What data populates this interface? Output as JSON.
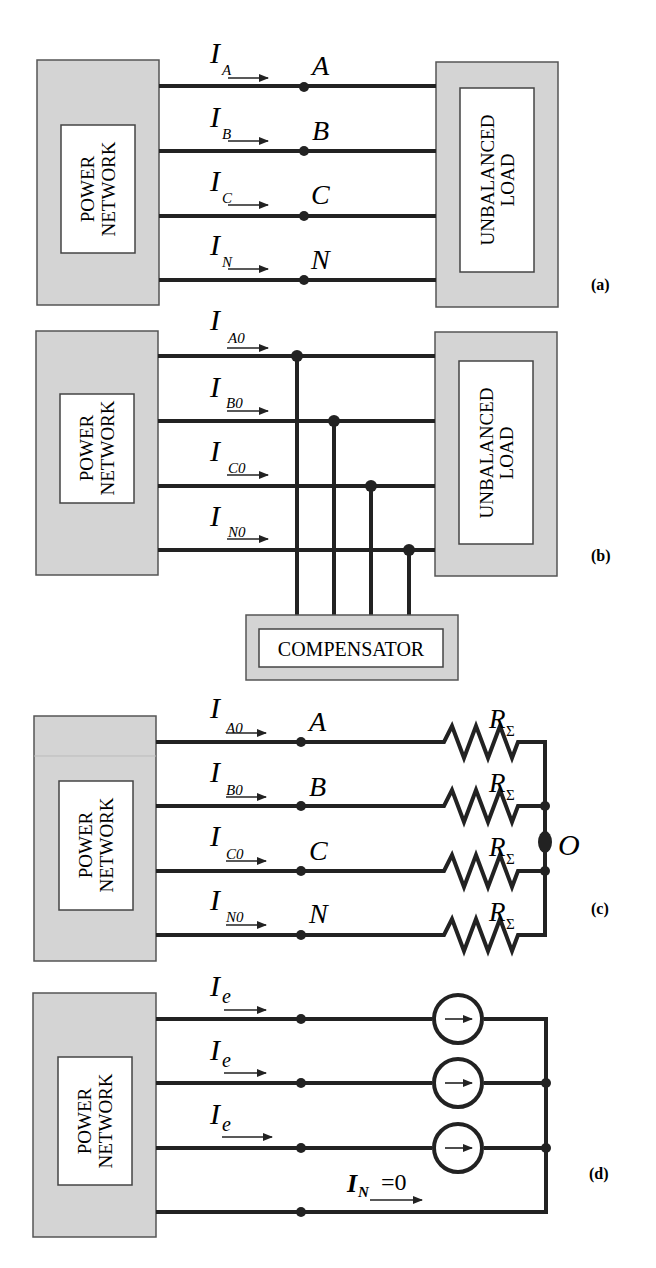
{
  "panels": {
    "a": {
      "label": "(a)",
      "source_box": "POWER NETWORK",
      "source_line1": "POWER",
      "source_line2": "NETWORK",
      "load_line1": "UNBALANCED",
      "load_line2": "LOAD",
      "currents": [
        {
          "main": "I",
          "sub": "A",
          "node": "A"
        },
        {
          "main": "I",
          "sub": "B",
          "node": "B"
        },
        {
          "main": "I",
          "sub": "C",
          "node": "C"
        },
        {
          "main": "I",
          "sub": "N",
          "node": "N"
        }
      ]
    },
    "b": {
      "label": "(b)",
      "source_line1": "POWER",
      "source_line2": "NETWORK",
      "load_line1": "UNBALANCED",
      "load_line2": "LOAD",
      "compensator": "COMPENSATOR",
      "currents": [
        {
          "main": "I",
          "sub": "A0"
        },
        {
          "main": "I",
          "sub": "B0"
        },
        {
          "main": "I",
          "sub": "C0"
        },
        {
          "main": "I",
          "sub": "N0"
        }
      ]
    },
    "c": {
      "label": "(c)",
      "source_line1": "POWER",
      "source_line2": "NETWORK",
      "neutral_point": "O",
      "resistor_main": "R",
      "resistor_sub": "Σ",
      "currents": [
        {
          "main": "I",
          "sub": "A0",
          "node": "A"
        },
        {
          "main": "I",
          "sub": "B0",
          "node": "B"
        },
        {
          "main": "I",
          "sub": "C0",
          "node": "C"
        },
        {
          "main": "I",
          "sub": "N0",
          "node": "N"
        }
      ]
    },
    "d": {
      "label": "(d)",
      "source_line1": "POWER",
      "source_line2": "NETWORK",
      "currents": [
        {
          "main": "I",
          "sub": "e"
        },
        {
          "main": "I",
          "sub": "e"
        },
        {
          "main": "I",
          "sub": "e"
        }
      ],
      "neutral_current_main": "I",
      "neutral_current_sub": "N",
      "neutral_current_value": "=0"
    }
  }
}
